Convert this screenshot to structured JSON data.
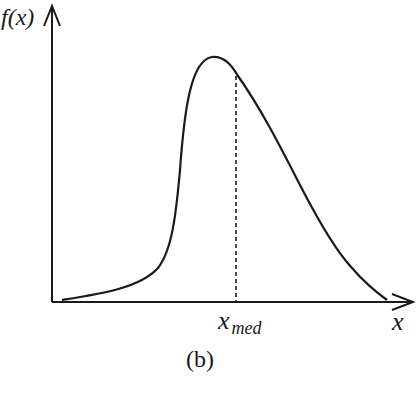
{
  "figure": {
    "y_axis_label": "f(x)",
    "x_axis_label": "x",
    "median_label_base": "x",
    "median_label_sub": "med",
    "caption": "(b)"
  },
  "colors": {
    "ink": "#1a1a1a",
    "background": "#ffffff"
  },
  "curve": {
    "description": "Right-skewed unimodal probability density with dashed vertical line at the median",
    "start_px": [
      62,
      300
    ],
    "peak_px": [
      212,
      57
    ],
    "median_px": [
      236,
      75
    ],
    "end_px": [
      387,
      300
    ]
  }
}
